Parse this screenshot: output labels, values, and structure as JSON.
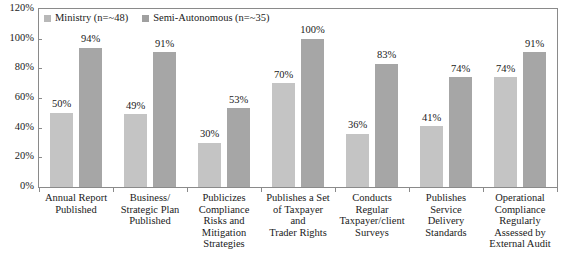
{
  "chart_data": {
    "type": "bar",
    "title": "",
    "subtitle": "",
    "xlabel": "",
    "ylabel": "",
    "ylim": [
      0,
      120
    ],
    "ytick_labels": [
      "0%",
      "20%",
      "40%",
      "60%",
      "80%",
      "100%",
      "120%"
    ],
    "ytick_values": [
      0,
      20,
      40,
      60,
      80,
      100,
      120
    ],
    "grid": false,
    "legend_position": "top-left",
    "categories": [
      "Annual Report Published",
      "Business/ Strategic Plan Published",
      "Publicizes Compliance Risks and Mitigation Strategies",
      "Publishes a Set of Taxpayer and Trader Rights",
      "Conducts Regular Taxpayer/client Surveys",
      "Publishes Service Delivery Standards",
      "Operational Compliance Regularly Assessed by External Audit"
    ],
    "category_lines": [
      [
        "Annual Report",
        "Published"
      ],
      [
        "Business/",
        "Strategic Plan",
        "Published"
      ],
      [
        "Publicizes",
        "Compliance",
        "Risks and",
        "Mitigation",
        "Strategies"
      ],
      [
        "Publishes a Set",
        "of Taxpayer",
        "and",
        "Trader Rights"
      ],
      [
        "Conducts",
        "Regular",
        "Taxpayer/client",
        "Surveys"
      ],
      [
        "Publishes",
        "Service",
        "Delivery",
        "Standards"
      ],
      [
        "Operational",
        "Compliance",
        "Regularly",
        "Assessed by",
        "External Audit"
      ]
    ],
    "series": [
      {
        "name": "Ministry (n=~48)",
        "color": "#c4c4c4",
        "values": [
          50,
          49,
          30,
          70,
          36,
          41,
          74
        ],
        "value_labels": [
          "50%",
          "49%",
          "30%",
          "70%",
          "36%",
          "41%",
          "74%"
        ]
      },
      {
        "name": "Semi-Autonomous (n=~35)",
        "color": "#a6a6a6",
        "values": [
          94,
          91,
          53,
          100,
          83,
          74,
          91
        ],
        "value_labels": [
          "94%",
          "91%",
          "53%",
          "100%",
          "83%",
          "74%",
          "91%"
        ]
      }
    ]
  },
  "legend": {
    "items": [
      {
        "label": "Ministry (n=~48)",
        "color": "#b8b8b8"
      },
      {
        "label": "Semi-Autonomous (n=~35)",
        "color": "#a0a0a0"
      }
    ]
  },
  "colors": {
    "series_light": "#c4c4c4",
    "series_dark": "#a6a6a6",
    "axis": "#8a8a8a",
    "text": "#1a1a1a",
    "background": "#ffffff"
  }
}
